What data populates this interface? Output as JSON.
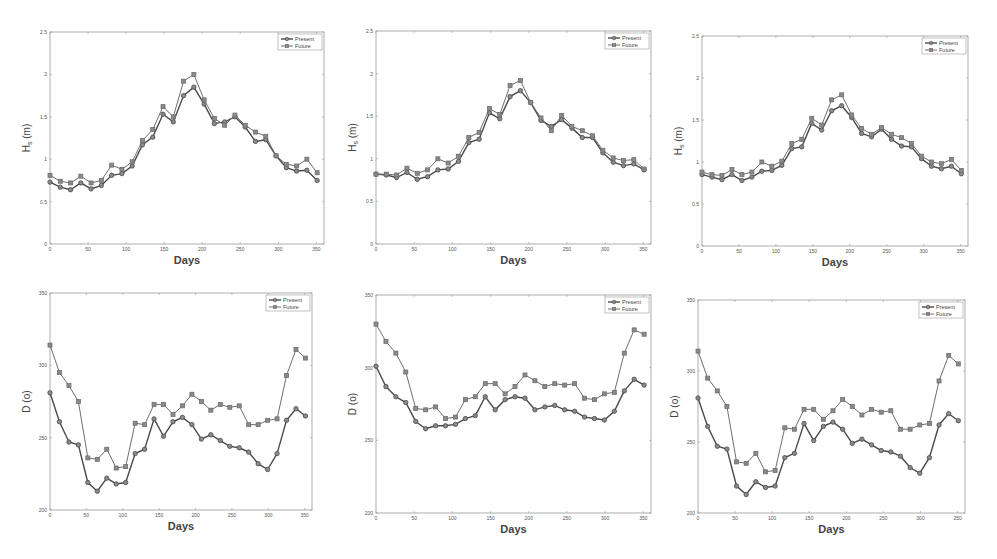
{
  "figure": {
    "panels_layout": "2 rows x 3 columns",
    "legend_labels": [
      "Present",
      "Future"
    ]
  },
  "colors": {
    "present": "#4a4a4a",
    "future": "#6e6e6e",
    "axis": "#9a9a9a",
    "background": "#ffffff"
  },
  "chart_data": [
    {
      "id": "hs-left",
      "type": "line",
      "title": "",
      "xlabel": "Days",
      "ylabel": "Hs (m)",
      "ylabel_main": "H",
      "ylabel_sub": "s",
      "ylabel_unit": " (m)",
      "xlim": [
        0,
        360
      ],
      "ylim": [
        0,
        2.5
      ],
      "xticks": [
        0,
        50,
        100,
        150,
        200,
        250,
        300,
        350
      ],
      "xtick_labels": [
        "0",
        "50",
        "100",
        "150",
        "200",
        "250",
        "300",
        "350"
      ],
      "yticks": [
        0,
        0.5,
        1,
        1.5,
        2,
        2.5
      ],
      "ytick_labels": [
        "0",
        "0.5",
        "1",
        "1.5",
        "2",
        "2.5"
      ],
      "grid": false,
      "legend_position": "upper right",
      "box": {
        "x": 50,
        "y": 32,
        "w": 274,
        "h": 212
      },
      "x": [
        0,
        13.5,
        27,
        40.5,
        54,
        67.5,
        81,
        94.5,
        108,
        121.5,
        135,
        148.5,
        162,
        175.5,
        189,
        202.5,
        216,
        229.5,
        243,
        256.5,
        270,
        283.5,
        297,
        310.5,
        324,
        337.5,
        351
      ],
      "series": [
        {
          "name": "Present",
          "values": [
            0.73,
            0.67,
            0.64,
            0.72,
            0.65,
            0.69,
            0.81,
            0.83,
            0.92,
            1.17,
            1.26,
            1.53,
            1.44,
            1.75,
            1.85,
            1.65,
            1.42,
            1.44,
            1.5,
            1.38,
            1.21,
            1.23,
            1.04,
            0.9,
            0.86,
            0.87,
            0.75
          ]
        },
        {
          "name": "Future",
          "values": [
            0.81,
            0.74,
            0.72,
            0.8,
            0.72,
            0.75,
            0.93,
            0.88,
            0.97,
            1.22,
            1.35,
            1.62,
            1.5,
            1.92,
            2.0,
            1.7,
            1.48,
            1.4,
            1.52,
            1.4,
            1.32,
            1.27,
            1.04,
            0.94,
            0.92,
            1.0,
            0.84
          ]
        }
      ]
    },
    {
      "id": "hs-middle",
      "type": "line",
      "title": "",
      "xlabel": "Days",
      "ylabel": "Hs (m)",
      "ylabel_main": "H",
      "ylabel_sub": "s",
      "ylabel_unit": " (m)",
      "xlim": [
        0,
        360
      ],
      "ylim": [
        0,
        2.5
      ],
      "xticks": [
        0,
        50,
        100,
        150,
        200,
        250,
        300,
        350
      ],
      "xtick_labels": [
        "0",
        "50",
        "100",
        "150",
        "200",
        "250",
        "300",
        "350"
      ],
      "yticks": [
        0,
        0.5,
        1,
        1.5,
        2,
        2.5
      ],
      "ytick_labels": [
        "0",
        "0.5",
        "1",
        "1.5",
        "2",
        "2.5"
      ],
      "grid": false,
      "legend_position": "upper right",
      "box": {
        "x": 376,
        "y": 31,
        "w": 275,
        "h": 213
      },
      "x": [
        0,
        13.5,
        27,
        40.5,
        54,
        67.5,
        81,
        94.5,
        108,
        121.5,
        135,
        148.5,
        162,
        175.5,
        189,
        202.5,
        216,
        229.5,
        243,
        256.5,
        270,
        283.5,
        297,
        310.5,
        324,
        337.5,
        351
      ],
      "series": [
        {
          "name": "Present",
          "values": [
            0.82,
            0.81,
            0.78,
            0.84,
            0.76,
            0.79,
            0.87,
            0.88,
            0.97,
            1.19,
            1.23,
            1.54,
            1.47,
            1.73,
            1.8,
            1.66,
            1.45,
            1.38,
            1.46,
            1.36,
            1.25,
            1.25,
            1.07,
            0.96,
            0.92,
            0.94,
            0.87
          ]
        },
        {
          "name": "Future",
          "values": [
            0.82,
            0.82,
            0.81,
            0.89,
            0.83,
            0.87,
            1.0,
            0.95,
            1.03,
            1.25,
            1.31,
            1.59,
            1.52,
            1.86,
            1.92,
            1.66,
            1.48,
            1.33,
            1.51,
            1.38,
            1.33,
            1.27,
            1.1,
            1.01,
            0.98,
            0.99,
            0.88
          ]
        }
      ]
    },
    {
      "id": "hs-right",
      "type": "line",
      "title": "",
      "xlabel": "Days",
      "ylabel": "Hs (m)",
      "ylabel_main": "H",
      "ylabel_sub": "s",
      "ylabel_unit": " (m)",
      "xlim": [
        0,
        360
      ],
      "ylim": [
        0,
        2.5
      ],
      "xticks": [
        0,
        50,
        100,
        150,
        200,
        250,
        300,
        350
      ],
      "xtick_labels": [
        "0",
        "50",
        "100",
        "150",
        "200",
        "250",
        "300",
        "350"
      ],
      "yticks": [
        0,
        0.5,
        1,
        1.5,
        2,
        2.5
      ],
      "ytick_labels": [
        "0",
        "0.5",
        "1",
        "1.5",
        "2",
        "2.5"
      ],
      "grid": false,
      "legend_position": "upper right",
      "box": {
        "x": 702,
        "y": 36,
        "w": 266,
        "h": 210
      },
      "x": [
        0,
        13.5,
        27,
        40.5,
        54,
        67.5,
        81,
        94.5,
        108,
        121.5,
        135,
        148.5,
        162,
        175.5,
        189,
        202.5,
        216,
        229.5,
        243,
        256.5,
        270,
        283.5,
        297,
        310.5,
        324,
        337.5,
        351
      ],
      "series": [
        {
          "name": "Present",
          "values": [
            0.85,
            0.82,
            0.79,
            0.85,
            0.78,
            0.82,
            0.89,
            0.9,
            0.96,
            1.16,
            1.18,
            1.46,
            1.38,
            1.61,
            1.67,
            1.53,
            1.34,
            1.3,
            1.39,
            1.27,
            1.19,
            1.18,
            1.04,
            0.95,
            0.92,
            0.95,
            0.86
          ]
        },
        {
          "name": "Future",
          "values": [
            0.88,
            0.85,
            0.84,
            0.91,
            0.85,
            0.88,
            1.0,
            0.95,
            1.01,
            1.22,
            1.27,
            1.52,
            1.44,
            1.74,
            1.8,
            1.56,
            1.4,
            1.33,
            1.41,
            1.33,
            1.29,
            1.22,
            1.07,
            1.0,
            0.98,
            1.03,
            0.9
          ]
        }
      ]
    },
    {
      "id": "dir-left",
      "type": "line",
      "title": "",
      "xlabel": "Days",
      "ylabel": "D (o)",
      "xlim": [
        0,
        360
      ],
      "ylim": [
        200,
        350
      ],
      "xticks": [
        0,
        50,
        100,
        150,
        200,
        250,
        300,
        350
      ],
      "xtick_labels": [
        "0",
        "50",
        "100",
        "150",
        "200",
        "250",
        "300",
        "350"
      ],
      "yticks": [
        200,
        250,
        300,
        350
      ],
      "ytick_labels": [
        "200",
        "250",
        "300",
        "350"
      ],
      "grid": false,
      "legend_position": "upper right",
      "box": {
        "x": 50,
        "y": 293,
        "w": 262,
        "h": 217
      },
      "x": [
        0,
        13.5,
        27,
        40.5,
        54,
        67.5,
        81,
        94.5,
        108,
        121.5,
        135,
        148.5,
        162,
        175.5,
        189,
        202.5,
        216,
        229.5,
        243,
        256.5,
        270,
        283.5,
        297,
        310.5,
        324,
        337.5,
        351
      ],
      "series": [
        {
          "name": "Present",
          "values": [
            281,
            261,
            247,
            245,
            219,
            213,
            222,
            218,
            219,
            239,
            242,
            263,
            251,
            261,
            264,
            259,
            249,
            252,
            248,
            244,
            243,
            240,
            232,
            228,
            239,
            262,
            270,
            265
          ]
        },
        {
          "name": "Future",
          "values": [
            314,
            295,
            286,
            275,
            236,
            235,
            242,
            229,
            230,
            260,
            259,
            273,
            273,
            266,
            272,
            280,
            275,
            269,
            273,
            271,
            272,
            259,
            259,
            262,
            263,
            293,
            311,
            305
          ]
        }
      ]
    },
    {
      "id": "dir-middle",
      "type": "line",
      "title": "",
      "xlabel": "Days",
      "ylabel": "D (o)",
      "xlim": [
        0,
        360
      ],
      "ylim": [
        200,
        350
      ],
      "xticks": [
        0,
        50,
        100,
        150,
        200,
        250,
        300,
        350
      ],
      "xtick_labels": [
        "0",
        "50",
        "100",
        "150",
        "200",
        "250",
        "300",
        "350"
      ],
      "yticks": [
        200,
        250,
        300,
        350
      ],
      "ytick_labels": [
        "200",
        "250",
        "300",
        "350"
      ],
      "grid": false,
      "legend_position": "upper right",
      "box": {
        "x": 376,
        "y": 295,
        "w": 275,
        "h": 218
      },
      "x": [
        0,
        13.5,
        27,
        40.5,
        54,
        67.5,
        81,
        94.5,
        108,
        121.5,
        135,
        148.5,
        162,
        175.5,
        189,
        202.5,
        216,
        229.5,
        243,
        256.5,
        270,
        283.5,
        297,
        310.5,
        324,
        337.5,
        351
      ],
      "series": [
        {
          "name": "Present",
          "values": [
            301,
            287,
            280,
            276,
            263,
            258,
            260,
            260,
            261,
            265,
            267,
            280,
            271,
            278,
            280,
            279,
            271,
            273,
            274,
            271,
            270,
            266,
            265,
            264,
            270,
            284,
            292,
            288
          ]
        },
        {
          "name": "Future",
          "values": [
            330,
            318,
            310,
            297,
            272,
            271,
            273,
            265,
            266,
            278,
            280,
            289,
            289,
            282,
            287,
            295,
            291,
            287,
            289,
            288,
            289,
            279,
            278,
            282,
            283,
            310,
            326,
            323
          ]
        }
      ]
    },
    {
      "id": "dir-right",
      "type": "line",
      "title": "",
      "xlabel": "Days",
      "ylabel": "D (o)",
      "xlim": [
        0,
        360
      ],
      "ylim": [
        200,
        350
      ],
      "xticks": [
        0,
        50,
        100,
        150,
        200,
        250,
        300,
        350
      ],
      "xtick_labels": [
        "0",
        "50",
        "100",
        "150",
        "200",
        "250",
        "300",
        "250"
      ],
      "yticks": [
        200,
        250,
        300,
        350
      ],
      "ytick_labels": [
        "200",
        "250",
        "300",
        "350"
      ],
      "grid": false,
      "legend_position": "upper right",
      "box": {
        "x": 698,
        "y": 300,
        "w": 267,
        "h": 213
      },
      "x": [
        0,
        13.5,
        27,
        40.5,
        54,
        67.5,
        81,
        94.5,
        108,
        121.5,
        135,
        148.5,
        162,
        175.5,
        189,
        202.5,
        216,
        229.5,
        243,
        256.5,
        270,
        283.5,
        297,
        310.5,
        324,
        337.5,
        351
      ],
      "series": [
        {
          "name": "Present",
          "values": [
            281,
            261,
            247,
            245,
            219,
            213,
            222,
            218,
            219,
            239,
            242,
            263,
            251,
            261,
            264,
            259,
            249,
            252,
            248,
            244,
            243,
            240,
            232,
            228,
            239,
            262,
            270,
            265
          ]
        },
        {
          "name": "Future",
          "values": [
            314,
            295,
            286,
            275,
            236,
            235,
            242,
            229,
            230,
            260,
            259,
            273,
            273,
            266,
            272,
            280,
            275,
            269,
            273,
            271,
            272,
            259,
            259,
            262,
            263,
            293,
            311,
            305
          ]
        }
      ]
    }
  ]
}
